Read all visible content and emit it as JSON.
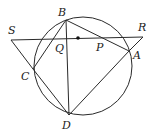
{
  "diagram": {
    "type": "circle-geometry",
    "circle": {
      "cx": 83,
      "cy": 66,
      "r": 49
    },
    "points": {
      "B": {
        "x": 66,
        "y": 20,
        "label": "B",
        "lx": 58,
        "ly": 16
      },
      "C": {
        "x": 33,
        "y": 69,
        "label": "C",
        "lx": 21,
        "ly": 80
      },
      "D": {
        "x": 69,
        "y": 115,
        "label": "D",
        "lx": 62,
        "ly": 129
      },
      "A": {
        "x": 129,
        "y": 51,
        "label": "A",
        "lx": 133,
        "ly": 59
      },
      "S": {
        "x": 11,
        "y": 40,
        "label": "S",
        "lx": 8,
        "ly": 34
      },
      "R": {
        "x": 143,
        "y": 37,
        "label": "R",
        "lx": 138,
        "ly": 31
      },
      "Q": {
        "x": 67,
        "y": 39,
        "label": "Q",
        "lx": 55,
        "ly": 52
      },
      "P": {
        "x": 101,
        "y": 38,
        "label": "P",
        "lx": 96,
        "ly": 51
      }
    },
    "center_dot": {
      "x": 78,
      "y": 38
    },
    "segments": [
      [
        "S",
        "R"
      ],
      [
        "S",
        "C"
      ],
      [
        "R",
        "A"
      ],
      [
        "B",
        "C"
      ],
      [
        "B",
        "D"
      ],
      [
        "B",
        "A"
      ],
      [
        "C",
        "D"
      ],
      [
        "D",
        "A"
      ]
    ],
    "labels": [
      "S",
      "B",
      "R",
      "Q",
      "P",
      "A",
      "C",
      "D"
    ]
  }
}
